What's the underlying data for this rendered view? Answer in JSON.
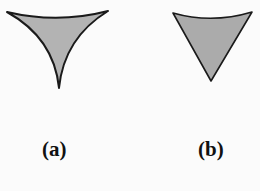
{
  "figure": {
    "panels": [
      {
        "label": "(a)",
        "shape": "concave-sided triangle (cusped tip)",
        "fill": "#b0b0b0",
        "stroke": "#1a1a1a"
      },
      {
        "label": "(b)",
        "shape": "straight-sided triangle with curved top",
        "fill": "#a9a9a9",
        "stroke": "#1a1a1a"
      }
    ]
  }
}
